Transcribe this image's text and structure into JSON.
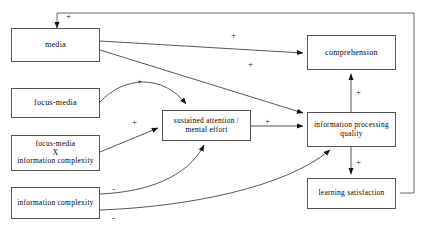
{
  "diagram": {
    "type": "path-model",
    "title": "",
    "nodes": [
      {
        "id": "media",
        "label": "media",
        "x": 11,
        "y": 28,
        "w": 89,
        "h": 34,
        "font": 8
      },
      {
        "id": "focus_media",
        "label": "focus-media",
        "x": 11,
        "y": 88,
        "w": 89,
        "h": 30,
        "font": 8
      },
      {
        "id": "focus_media_x_ic",
        "label": "focus-media\nX\ninformation complexity",
        "x": 11,
        "y": 135,
        "w": 89,
        "h": 36,
        "font": 7.4
      },
      {
        "id": "information_complexity",
        "label": "information complexity",
        "x": 11,
        "y": 187,
        "w": 89,
        "h": 32,
        "font": 7.4
      },
      {
        "id": "sustained_attention",
        "label": "sustained attention /\nmental effort",
        "x": 162,
        "y": 110,
        "w": 89,
        "h": 31,
        "font": 7.4
      },
      {
        "id": "comprehension",
        "label": "comprehension",
        "x": 307,
        "y": 35,
        "w": 89,
        "h": 35,
        "font": 8
      },
      {
        "id": "information_processing_quality",
        "label": "information processing\nquality",
        "x": 307,
        "y": 112,
        "w": 89,
        "h": 35,
        "font": 7.4
      },
      {
        "id": "learning_satisfaction",
        "label": "learning satisfaction",
        "x": 307,
        "y": 178,
        "w": 89,
        "h": 31,
        "font": 7.4
      }
    ],
    "signs": [
      {
        "id": "sign-feedback-media",
        "text": "+",
        "x": 66,
        "y": 12
      },
      {
        "id": "sign-media-comprehension",
        "text": "+",
        "x": 231,
        "y": 31
      },
      {
        "id": "sign-media-ipq",
        "text": "+",
        "x": 248,
        "y": 60
      },
      {
        "id": "sign-focusmedia-sa",
        "text": "+",
        "x": 137,
        "y": 77
      },
      {
        "id": "sign-interaction-sa",
        "text": "+",
        "x": 132,
        "y": 118
      },
      {
        "id": "sign-sa-ipq",
        "text": "+",
        "x": 265,
        "y": 117
      },
      {
        "id": "sign-comp-ipq",
        "text": "+",
        "x": 356,
        "y": 88
      },
      {
        "id": "sign-ipq-ls",
        "text": "+",
        "x": 356,
        "y": 158
      },
      {
        "id": "sign-ic-sa",
        "text": "-",
        "x": 112,
        "y": 185
      },
      {
        "id": "sign-ic-ipq",
        "text": "-",
        "x": 112,
        "y": 214
      }
    ],
    "edges": [
      {
        "id": "edge-learning-satisfaction-to-media",
        "from": "learning_satisfaction",
        "to": "media",
        "sign": "+"
      },
      {
        "id": "edge-media-to-comprehension",
        "from": "media",
        "to": "comprehension",
        "sign": "+"
      },
      {
        "id": "edge-media-to-information-processing-quality",
        "from": "media",
        "to": "information_processing_quality",
        "sign": "+"
      },
      {
        "id": "edge-focus-media-to-sustained-attention",
        "from": "focus_media",
        "to": "sustained_attention",
        "sign": "+"
      },
      {
        "id": "edge-interaction-to-sustained-attention",
        "from": "focus_media_x_ic",
        "to": "sustained_attention",
        "sign": "+"
      },
      {
        "id": "edge-information-complexity-to-sustained-attention",
        "from": "information_complexity",
        "to": "sustained_attention",
        "sign": "-"
      },
      {
        "id": "edge-information-complexity-to-information-processing-quality",
        "from": "information_complexity",
        "to": "information_processing_quality",
        "sign": "-"
      },
      {
        "id": "edge-sustained-attention-to-information-processing-quality",
        "from": "sustained_attention",
        "to": "information_processing_quality",
        "sign": "+"
      },
      {
        "id": "edge-information-processing-quality-to-comprehension",
        "from": "information_processing_quality",
        "to": "comprehension",
        "sign": "+"
      },
      {
        "id": "edge-information-processing-quality-to-learning-satisfaction",
        "from": "information_processing_quality",
        "to": "learning_satisfaction",
        "sign": "+"
      }
    ]
  }
}
